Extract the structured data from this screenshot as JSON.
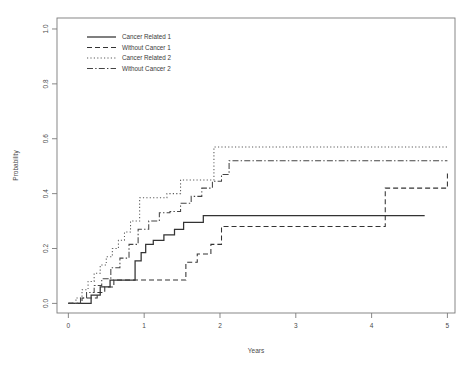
{
  "chart_data": {
    "type": "line",
    "title": "",
    "subtitle": "",
    "xlabel": "Years",
    "ylabel": "Probability",
    "xlim": [
      -0.15,
      5.1
    ],
    "ylim": [
      -0.035,
      1.04
    ],
    "xticks": [
      0,
      1,
      2,
      3,
      4,
      5
    ],
    "xticklabels": [
      "0",
      "1",
      "2",
      "3",
      "4",
      "5"
    ],
    "yticks": [
      0.0,
      0.2,
      0.4,
      0.6,
      0.8,
      1.0
    ],
    "yticklabels": [
      "0.0",
      "0.2",
      "0.4",
      "0.6",
      "0.8",
      "1.0"
    ],
    "grid": false,
    "frame": true,
    "step_type": "post",
    "legend": {
      "position": "top-left",
      "entries": [
        "Cancer Related 1",
        "Without Cancer 1",
        "Cancer Related 2",
        "Without Cancer 2"
      ]
    },
    "series": [
      {
        "name": "Cancer Related 1",
        "linestyle": "solid",
        "color": "#333333",
        "x": [
          0.0,
          0.14,
          0.3,
          0.42,
          0.55,
          0.62,
          0.74,
          0.8,
          0.88,
          0.96,
          1.02,
          1.12,
          1.26,
          1.4,
          1.52,
          1.78,
          4.7
        ],
        "y": [
          0.0,
          0.0,
          0.03,
          0.06,
          0.085,
          0.085,
          0.085,
          0.085,
          0.155,
          0.185,
          0.215,
          0.23,
          0.25,
          0.27,
          0.295,
          0.32,
          0.32
        ]
      },
      {
        "name": "Without Cancer 1",
        "linestyle": "dashed",
        "color": "#333333",
        "x": [
          0.0,
          0.18,
          0.28,
          0.38,
          0.48,
          0.6,
          0.72,
          0.86,
          1.0,
          1.55,
          1.7,
          1.88,
          2.02,
          4.05,
          4.18,
          4.9,
          5.0
        ],
        "y": [
          0.0,
          0.02,
          0.02,
          0.04,
          0.06,
          0.085,
          0.085,
          0.085,
          0.085,
          0.15,
          0.18,
          0.215,
          0.28,
          0.28,
          0.42,
          0.42,
          0.48
        ]
      },
      {
        "name": "Cancer Related 2",
        "linestyle": "dotted",
        "color": "#5a5a5a",
        "x": [
          0.0,
          0.1,
          0.18,
          0.26,
          0.34,
          0.42,
          0.5,
          0.58,
          0.66,
          0.74,
          0.82,
          0.94,
          1.1,
          1.3,
          1.48,
          1.58,
          1.82,
          1.92,
          5.0
        ],
        "y": [
          0.0,
          0.02,
          0.05,
          0.08,
          0.11,
          0.14,
          0.17,
          0.2,
          0.23,
          0.26,
          0.3,
          0.385,
          0.385,
          0.4,
          0.45,
          0.45,
          0.45,
          0.57,
          0.57
        ]
      },
      {
        "name": "Without Cancer 2",
        "linestyle": "dashdot",
        "color": "#444444",
        "x": [
          0.0,
          0.16,
          0.24,
          0.34,
          0.44,
          0.56,
          0.68,
          0.8,
          0.92,
          1.06,
          1.2,
          1.34,
          1.48,
          1.62,
          1.76,
          1.9,
          2.02,
          2.12,
          5.0
        ],
        "y": [
          0.0,
          0.02,
          0.04,
          0.065,
          0.09,
          0.13,
          0.165,
          0.215,
          0.27,
          0.3,
          0.33,
          0.335,
          0.365,
          0.39,
          0.42,
          0.445,
          0.47,
          0.52,
          0.52
        ]
      }
    ]
  },
  "colors": {
    "axis": "#7a7a7a",
    "text": "#4a4a4a",
    "background": "#ffffff"
  }
}
